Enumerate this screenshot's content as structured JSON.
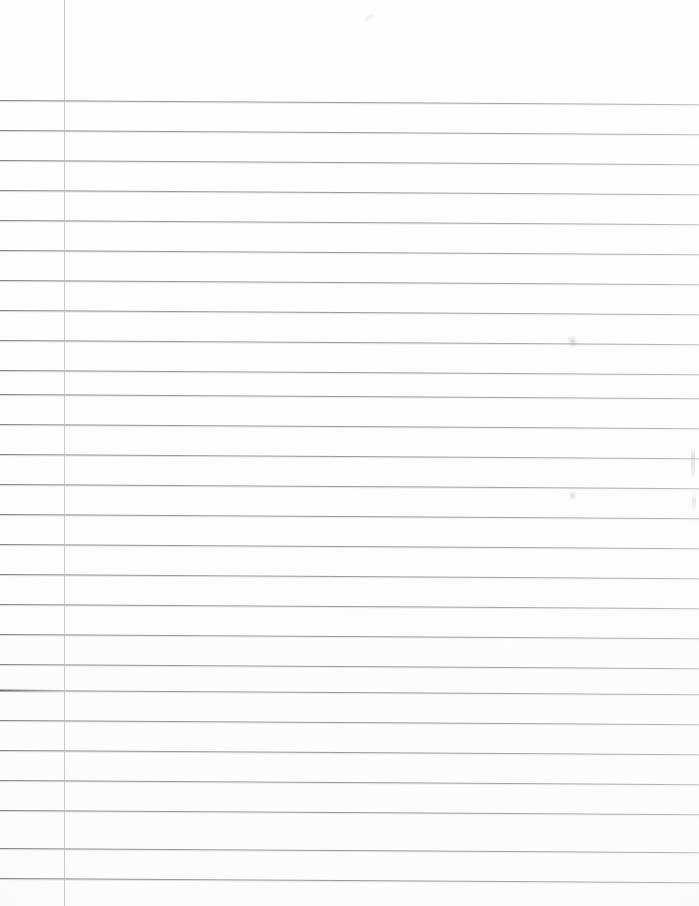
{
  "document": {
    "kind": "lined-notebook-paper-scan",
    "title": "Blank ruled notebook page",
    "page_width": 699,
    "page_height": 906,
    "background_color": "#fdfdfd",
    "written_content": "",
    "header_text": "",
    "footer_text": "",
    "page_number": ""
  },
  "ruling": {
    "style": "wide-ruled",
    "line_color": "#92929a",
    "line_thickness_px": 1,
    "line_spacing_px": 30,
    "first_line_y": 100,
    "last_line_y": 878,
    "line_count": 27,
    "top_blank_margin_px": 100,
    "bottom_blank_margin_px": 28,
    "line_tilt_deg": 0.35,
    "line_y_positions": [
      100,
      130,
      160,
      190,
      220,
      250,
      280,
      310,
      340,
      370,
      394,
      424,
      454,
      484,
      514,
      544,
      574,
      604,
      634,
      664,
      690,
      720,
      750,
      780,
      810,
      848,
      878
    ],
    "heavy_left_line_indices": [
      20
    ]
  },
  "margin_rule": {
    "orientation": "vertical",
    "x": 64,
    "color": "#bdbdc2",
    "thickness_px": 1,
    "top": 0,
    "bottom": 906,
    "full_height": true
  },
  "artifacts": [
    {
      "name": "speck-top-center",
      "x": 362,
      "y": 14,
      "label": "faint scan speck"
    },
    {
      "name": "smudge-upper-right",
      "x": 568,
      "y": 336,
      "label": "faint pencil smudge"
    },
    {
      "name": "smudge-mid-right",
      "x": 569,
      "y": 491,
      "label": "faint pencil dot"
    },
    {
      "name": "edge-mark-right",
      "x": 691,
      "y": 446,
      "label": "right edge scan mark"
    },
    {
      "name": "edge-mark-right-lower",
      "x": 692,
      "y": 492,
      "label": "right edge scan mark"
    }
  ]
}
